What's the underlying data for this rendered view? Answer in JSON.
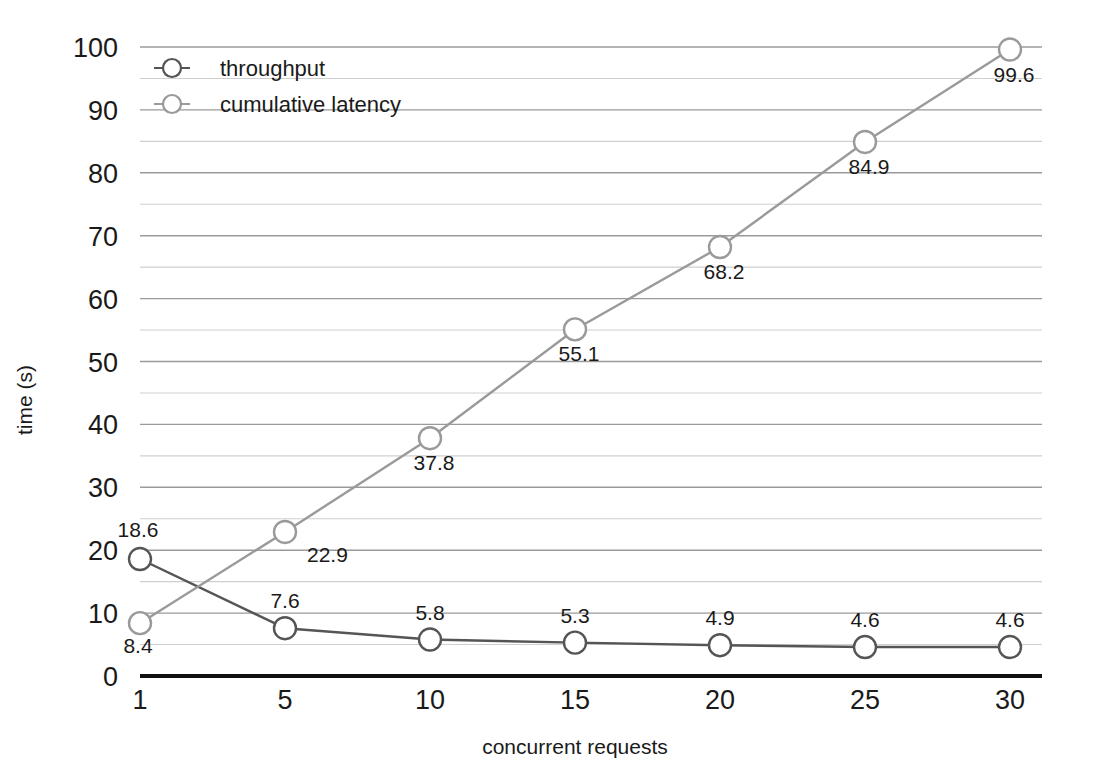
{
  "chart_data": {
    "type": "line",
    "title": "",
    "xlabel": "concurrent requests",
    "ylabel": "time (s)",
    "categories": [
      "1",
      "5",
      "10",
      "15",
      "20",
      "25",
      "30"
    ],
    "x": [
      1,
      5,
      10,
      15,
      20,
      25,
      30
    ],
    "ylim": [
      0,
      100
    ],
    "ytick_step": 10,
    "yminor_step": 5,
    "grid": true,
    "legend_position": "top-left",
    "series": [
      {
        "name": "throughput",
        "values": [
          18.6,
          7.6,
          5.8,
          5.3,
          4.9,
          4.6,
          4.6
        ],
        "labels": [
          "18.6",
          "7.6",
          "5.8",
          "5.3",
          "4.9",
          "4.6",
          "4.6"
        ],
        "color": "#555555",
        "marker": "open-circle"
      },
      {
        "name": "cumulative latency",
        "values": [
          8.4,
          22.9,
          37.8,
          55.1,
          68.2,
          84.9,
          99.6
        ],
        "labels": [
          "8.4",
          "22.9",
          "37.8",
          "55.1",
          "68.2",
          "84.9",
          "99.6"
        ],
        "color": "#9a9a9a",
        "marker": "open-circle"
      }
    ]
  },
  "axes": {
    "y_ticks": [
      "100",
      "90",
      "80",
      "70",
      "60",
      "50",
      "40",
      "30",
      "20",
      "10",
      "0"
    ],
    "x_ticks": [
      "1",
      "5",
      "10",
      "15",
      "20",
      "25",
      "30"
    ],
    "y_axis_title": "time (s)",
    "x_axis_title": "concurrent requests"
  },
  "legend": {
    "items": [
      {
        "label": "throughput",
        "color": "#555555"
      },
      {
        "label": "cumulative latency",
        "color": "#9a9a9a"
      }
    ]
  },
  "colors": {
    "background": "#ffffff",
    "text": "#1a1a1a",
    "grid_major": "#9a9a9a",
    "grid_minor": "#cfcfcf",
    "baseline": "#101010",
    "series_throughput": "#555555",
    "series_latency": "#9a9a9a",
    "marker_fill": "#ffffff"
  }
}
